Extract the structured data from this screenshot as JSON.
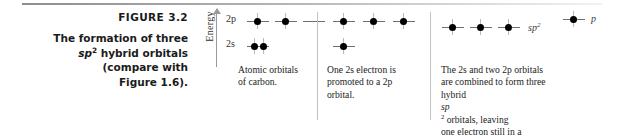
{
  "figure": {
    "number_label": "FIGURE 3.2",
    "caption_lines": [
      "The formation of three",
      "sp² hybrid orbitals",
      "(compare with",
      "Figure 1.6)."
    ]
  },
  "axis": {
    "label": "Energy",
    "direction_icon": "up-arrow-icon"
  },
  "orbital_labels": {
    "p_level": "2p",
    "s_level": "2s"
  },
  "panels": [
    {
      "id": "atomic-orbitals",
      "caption_lines": [
        "Atomic orbitals",
        "of carbon."
      ],
      "rows": [
        {
          "level": "2p",
          "slots": [
            1,
            1,
            0
          ]
        },
        {
          "level": "2s",
          "slots": [
            2
          ]
        }
      ]
    },
    {
      "id": "promotion",
      "caption_lines": [
        "One 2s electron is",
        "promoted to a 2p",
        "orbital."
      ],
      "rows": [
        {
          "level": "2p",
          "slots": [
            1,
            1,
            1
          ]
        },
        {
          "level": "2s",
          "slots": [
            1
          ]
        }
      ]
    },
    {
      "id": "hybridization",
      "caption_lines": [
        "The 2s and two 2p orbitals",
        "are combined to form three",
        "hybrid sp² orbitals, leaving",
        "one electron still in a",
        "p orbital."
      ],
      "rows": [
        {
          "level": "sp2",
          "slots": [
            1,
            1,
            1
          ]
        },
        {
          "level": "p",
          "slots": [
            1
          ]
        }
      ],
      "hybrid_label": "sp²",
      "p_label": "p"
    }
  ],
  "colors": {
    "electron": "#000000",
    "slot_line": "#6f6f6f",
    "divider": "#c2c2c2",
    "axis": "#9a9a9a",
    "text": "#1b1b1b"
  }
}
